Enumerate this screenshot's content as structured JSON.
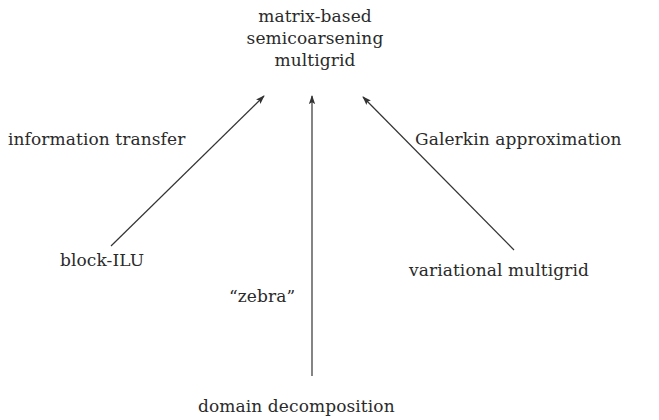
{
  "diagram": {
    "top_node": {
      "lines": [
        "matrix-based",
        "semicoarsening",
        "multigrid"
      ]
    },
    "nodes": {
      "left": "block-ILU",
      "right": "variational multigrid",
      "bottom": "domain decomposition"
    },
    "edges": {
      "left": {
        "label": "information transfer",
        "from": "block-ILU",
        "to": "matrix-based semicoarsening multigrid"
      },
      "middle": {
        "label": "“zebra”",
        "from": "domain decomposition",
        "to": "matrix-based semicoarsening multigrid"
      },
      "right": {
        "label": "Galerkin approximation",
        "from": "variational multigrid",
        "to": "matrix-based semicoarsening multigrid"
      }
    },
    "colors": {
      "text": "#2a2a2a",
      "arrow": "#333333",
      "background": "#ffffff"
    }
  }
}
